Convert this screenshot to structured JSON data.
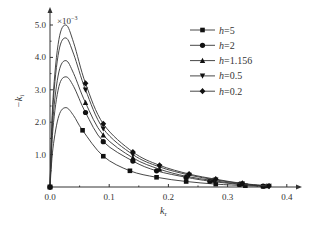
{
  "chart_data": {
    "type": "line",
    "title": "",
    "xlabel": "k_r",
    "ylabel": "-k_i",
    "y_multiplier": "×10^-3",
    "xlim": [
      0.0,
      0.42
    ],
    "ylim": [
      0.0,
      5.2
    ],
    "x_ticks": [
      "0.0",
      "0.1",
      "0.2",
      "0.3",
      "0.4"
    ],
    "y_ticks": [
      "1.0",
      "2.0",
      "3.0",
      "4.0",
      "5.0"
    ],
    "grid": false,
    "legend_position": "upper right",
    "series": [
      {
        "name": "h=5",
        "marker": "square",
        "x": [
          0.0,
          0.005,
          0.015,
          0.027,
          0.04,
          0.055,
          0.09,
          0.135,
          0.18,
          0.23,
          0.28,
          0.33,
          0.36
        ],
        "y": [
          0.0,
          1.2,
          2.2,
          2.45,
          2.2,
          1.75,
          0.95,
          0.5,
          0.3,
          0.17,
          0.09,
          0.04,
          0.02
        ]
      },
      {
        "name": "h=2",
        "marker": "circle",
        "x": [
          0.0,
          0.005,
          0.015,
          0.027,
          0.04,
          0.06,
          0.09,
          0.14,
          0.18,
          0.23,
          0.27,
          0.32,
          0.36
        ],
        "y": [
          0.0,
          1.8,
          3.1,
          3.4,
          3.1,
          2.3,
          1.4,
          0.8,
          0.5,
          0.3,
          0.18,
          0.08,
          0.03
        ]
      },
      {
        "name": "h=1.156",
        "marker": "triangle-up",
        "x": [
          0.0,
          0.005,
          0.015,
          0.027,
          0.04,
          0.06,
          0.09,
          0.14,
          0.185,
          0.23,
          0.275,
          0.32,
          0.365
        ],
        "y": [
          0.0,
          2.1,
          3.55,
          3.9,
          3.5,
          2.6,
          1.6,
          0.9,
          0.55,
          0.33,
          0.2,
          0.09,
          0.03
        ]
      },
      {
        "name": "h=0.5",
        "marker": "triangle-down",
        "x": [
          0.0,
          0.005,
          0.015,
          0.027,
          0.04,
          0.06,
          0.09,
          0.14,
          0.185,
          0.235,
          0.28,
          0.325,
          0.37
        ],
        "y": [
          0.0,
          2.5,
          4.2,
          4.6,
          4.1,
          3.0,
          1.8,
          1.0,
          0.62,
          0.37,
          0.22,
          0.1,
          0.03
        ]
      },
      {
        "name": "h=0.2",
        "marker": "diamond",
        "x": [
          0.0,
          0.005,
          0.015,
          0.027,
          0.04,
          0.06,
          0.09,
          0.14,
          0.185,
          0.235,
          0.28,
          0.325,
          0.37
        ],
        "y": [
          0.0,
          2.7,
          4.55,
          5.0,
          4.45,
          3.2,
          1.95,
          1.08,
          0.67,
          0.4,
          0.24,
          0.11,
          0.03
        ]
      }
    ]
  },
  "labels": {
    "multiplier": "×10",
    "multiplier_exp": "−3",
    "xlabel_main": "k",
    "xlabel_sub": "r",
    "ylabel_main": "−k",
    "ylabel_sub": "i"
  }
}
